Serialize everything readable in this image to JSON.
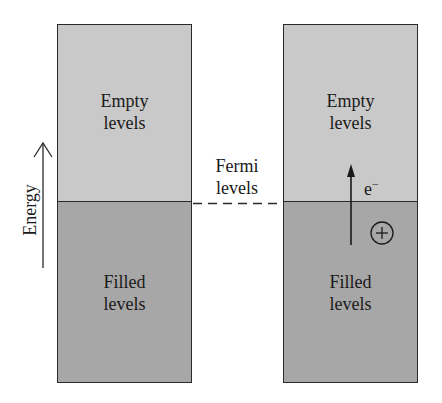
{
  "diagram": {
    "title": "",
    "axis": {
      "label": "Energy",
      "direction": "up"
    },
    "fermi": {
      "line1": "Fermi",
      "line2": "levels",
      "line_style": "dashed"
    },
    "left_box": {
      "empty": {
        "line1": "Empty",
        "line2": "levels"
      },
      "filled": {
        "line1": "Filled",
        "line2": "levels"
      }
    },
    "right_box": {
      "empty": {
        "line1": "Empty",
        "line2": "levels"
      },
      "filled": {
        "line1": "Filled",
        "line2": "levels"
      },
      "electron": {
        "symbol": "e",
        "charge": "−"
      },
      "hole": {
        "symbol": "+"
      }
    },
    "colors": {
      "empty_fill": "#c9c9c9",
      "filled_fill": "#a7a7a7",
      "stroke": "#2a2a2a",
      "background": "#ffffff"
    }
  }
}
